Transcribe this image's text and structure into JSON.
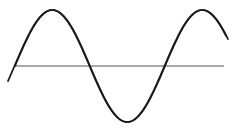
{
  "figure": {
    "title": "",
    "background_color": "#ffffff",
    "width": 238,
    "height": 131
  },
  "axis": {
    "name": "horizontal-baseline",
    "color": "#a8a8a8",
    "y": 66,
    "x_start": 15,
    "x_end": 224,
    "thickness": 1.2,
    "label": ""
  },
  "chart_data": {
    "type": "line",
    "title": "",
    "subtitle": "",
    "xlabel": "",
    "ylabel": "",
    "grid": false,
    "legend_position": "none",
    "annotations": [],
    "xlim": [
      0,
      238
    ],
    "ylim": [
      -1.25,
      1.25
    ],
    "baseline_y_px": 66,
    "amplitude_px": 56,
    "period_px": 150,
    "tick_labels": {
      "x": [],
      "y": []
    },
    "series": [
      {
        "name": "wave-1",
        "color": "#1a1a1a",
        "stroke_width": 1.7,
        "amplitude": 1.0,
        "period_px": 150,
        "phase_deg": 0,
        "zero_crossings_px": [
          15,
          90,
          165
        ],
        "peaks_px": [
          {
            "x": 53,
            "y": 10
          }
        ],
        "troughs_px": [
          {
            "x": 128,
            "y": 122
          }
        ],
        "x_start": 15,
        "x_end": 228
      },
      {
        "name": "wave-2",
        "color": "#1a1a1a",
        "stroke_width": 1.7,
        "amplitude": 1.0,
        "period_px": 150,
        "phase_deg": 90,
        "zero_crossings_px": [
          52,
          127,
          202
        ],
        "peaks_px": [
          {
            "x": 92,
            "y": 10
          }
        ],
        "troughs_px": [
          {
            "x": 12,
            "y": 122
          },
          {
            "x": 172,
            "y": 122
          }
        ],
        "x_start": 8,
        "x_end": 226
      }
    ]
  }
}
